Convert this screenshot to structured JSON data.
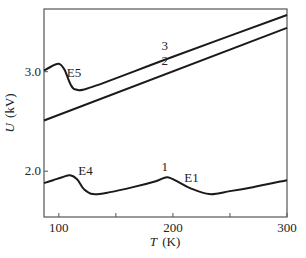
{
  "chart_data": {
    "type": "line",
    "title": "",
    "xlabel": "T (K)",
    "xlabel_var": "T",
    "xlabel_unit": "(K)",
    "ylabel": "U (kV)",
    "ylabel_var": "U",
    "ylabel_unit": "(kV)",
    "xlim": [
      87,
      300
    ],
    "ylim": [
      1.54,
      3.63
    ],
    "xticks": [
      100,
      150,
      200,
      250,
      300
    ],
    "xtick_labels": [
      "100",
      "",
      "200",
      "",
      "300"
    ],
    "yticks": [
      2.0,
      3.0
    ],
    "ytick_labels": [
      "2.0",
      "3.0"
    ],
    "grid": false,
    "legend": "none (curves labeled inline)",
    "series": [
      {
        "name": "1",
        "x": [
          87,
          95,
          103,
          110,
          116,
          122,
          130,
          145,
          165,
          185,
          195,
          205,
          215,
          232,
          250,
          270,
          300
        ],
        "y": [
          1.88,
          1.91,
          1.94,
          1.96,
          1.92,
          1.82,
          1.77,
          1.79,
          1.84,
          1.9,
          1.94,
          1.89,
          1.83,
          1.77,
          1.8,
          1.84,
          1.91
        ]
      },
      {
        "name": "2",
        "x": [
          87,
          300
        ],
        "y": [
          2.51,
          3.44
        ]
      },
      {
        "name": "3",
        "x": [
          87,
          93,
          100,
          105,
          110,
          115,
          130,
          200,
          300
        ],
        "y": [
          3.01,
          3.05,
          3.08,
          3.02,
          2.88,
          2.82,
          2.85,
          3.15,
          3.57
        ]
      }
    ],
    "annotations": [
      {
        "text": "E5",
        "x": 107,
        "y": 2.95
      },
      {
        "text": "E4",
        "x": 117,
        "y": 1.96
      },
      {
        "text": "E1",
        "x": 210,
        "y": 1.89
      },
      {
        "text": "1",
        "x": 190,
        "y": 2.0
      },
      {
        "text": "2",
        "x": 190,
        "y": 3.07
      },
      {
        "text": "3",
        "x": 190,
        "y": 3.22
      }
    ]
  }
}
